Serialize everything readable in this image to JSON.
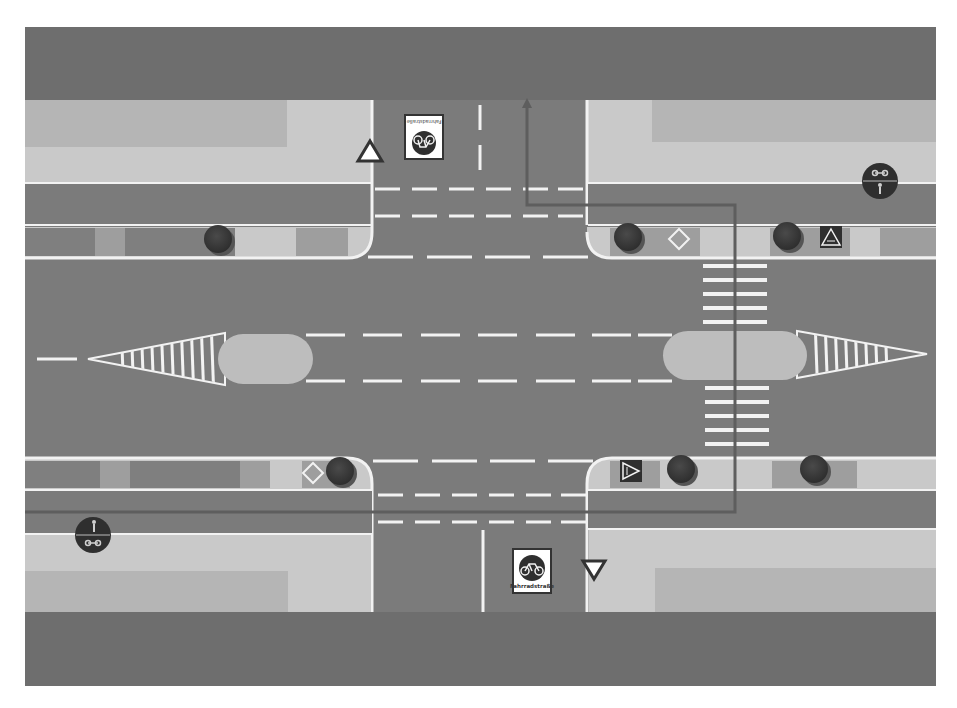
{
  "diagram": {
    "canvas": {
      "width": 957,
      "height": 708,
      "x0": 25,
      "y0": 27,
      "x1": 936,
      "y1": 686
    },
    "colors": {
      "background": "#ffffff",
      "asphalt": "#7b7b7b",
      "dark_band": "#6d6d6d",
      "sidewalk": "#c9c9c9",
      "sidewalk_inner": "#b3b3b3",
      "bike_lane": "#9a9a9a",
      "marking": "#f2f2f2",
      "island": "#bdbdbd",
      "route": "#5e5e5e",
      "tree": "#3d3d3d",
      "sign_dark": "#2f2f2f"
    },
    "signs": {
      "fahrradstrasse_top": {
        "type": "fahrradstrasse",
        "label": "Fahrradstraße",
        "x": 405,
        "y": 113,
        "rotated": true
      },
      "fahrradstrasse_bottom": {
        "type": "fahrradstrasse",
        "label": "Fahrradstraße",
        "x": 513,
        "y": 548,
        "rotated": false
      },
      "yield_top": {
        "type": "yield-triangle",
        "x": 370,
        "y": 152,
        "direction": "up"
      },
      "yield_bottom": {
        "type": "yield-triangle",
        "x": 593,
        "y": 568,
        "direction": "down"
      },
      "priority_ne": {
        "type": "priority-diamond",
        "x": 678,
        "y": 238
      },
      "priority_sw": {
        "type": "priority-diamond",
        "x": 313,
        "y": 473
      },
      "crossing_ne": {
        "type": "pedestrian-crossing",
        "x": 830,
        "y": 236
      },
      "crossing_se": {
        "type": "pedestrian-crossing",
        "x": 631,
        "y": 470
      },
      "shared_path_ne": {
        "type": "bike-pedestrian-shared",
        "x": 880,
        "y": 181
      },
      "shared_path_sw": {
        "type": "bike-pedestrian-shared",
        "x": 93,
        "y": 535
      }
    },
    "trees": [
      {
        "x": 218,
        "y": 239
      },
      {
        "x": 628,
        "y": 237
      },
      {
        "x": 787,
        "y": 236
      },
      {
        "x": 340,
        "y": 471
      },
      {
        "x": 681,
        "y": 469
      },
      {
        "x": 814,
        "y": 469
      }
    ],
    "route": {
      "points": "25,512 735,512 735,205 527,205 527,100",
      "arrow_end": "up"
    }
  }
}
